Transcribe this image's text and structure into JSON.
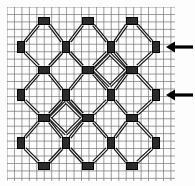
{
  "figure": {
    "caption": "",
    "background_color": "#fdfdfd",
    "ink_color": "#1a1a1a",
    "grid": {
      "visible": true,
      "color_minor": "#b9b9b9",
      "color_major": "#6e6e6e",
      "cell_size": 7.45,
      "major_every": 1,
      "x_start": 7,
      "y_start": 7,
      "x_end": 175,
      "y_end": 181,
      "columns": 23,
      "rows": 24
    },
    "node": {
      "label": "node-square",
      "fill": "#2b2b2b",
      "outline": "#000000",
      "width": 7,
      "height": 11,
      "horizontal_width": 11,
      "horizontal_height": 7
    },
    "bond": {
      "label": "double-line-bond",
      "style": "railroad",
      "color": "#111111",
      "outer_width": 3.4,
      "inner_width": 1.1,
      "inner_color": "#f4f4f4"
    },
    "lattice": {
      "node_columns_x": [
        21,
        66,
        111,
        156
      ],
      "node_rows_y": [
        47,
        95,
        143
      ],
      "mid_columns_x": [
        44,
        88,
        132
      ],
      "mid_rows_y": [
        21,
        70,
        118,
        166
      ],
      "motif_count": 16,
      "motif_type": "octagon-with-diamond-center"
    },
    "arrows": [
      {
        "name": "arrow-upper",
        "points_to": "right-edge node row 1",
        "x_tail": 193,
        "x_head": 166,
        "y": 47,
        "color": "#000000"
      },
      {
        "name": "arrow-lower",
        "points_to": "right-edge node row 2",
        "x_tail": 193,
        "x_head": 166,
        "y": 95,
        "color": "#000000"
      }
    ]
  }
}
